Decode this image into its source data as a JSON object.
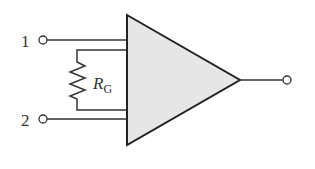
{
  "diagram": {
    "type": "instrumentation-amplifier",
    "inputs": [
      {
        "id": "1",
        "label": "1"
      },
      {
        "id": "2",
        "label": "2"
      }
    ],
    "resistor": {
      "label_main": "R",
      "label_sub": "G"
    },
    "output": {
      "label": ""
    },
    "colors": {
      "stroke": "#222222",
      "fill": "#e6e6e6",
      "text": "#333333",
      "background": "#ffffff"
    }
  }
}
